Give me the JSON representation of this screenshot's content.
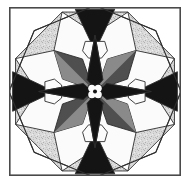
{
  "artwork": {
    "title": "Eight-Pointed Star Quilt Block",
    "type": "geometric-quilt-block",
    "width": 194,
    "height": 186,
    "background": "#ffffff"
  },
  "frame": {
    "name": "outer-border",
    "x": 9,
    "y": 7,
    "width": 172,
    "height": 169,
    "stroke": "#4a4a4a",
    "stroke_width": 1.6,
    "fill": "#ffffff"
  },
  "palette": {
    "white": "#fbfbfb",
    "speckled_light": "#d9d9d9",
    "speckle_dot": "#b4b4b4",
    "medium_gray": "#8a8a8a",
    "dark_gray": "#4f4f4f",
    "black": "#141414",
    "seam": "#2e2e2e",
    "frame": "#4a4a4a"
  },
  "geometry": {
    "center_x": 95,
    "center_y": 91.5,
    "octagon_radius": 86,
    "star_outer_radius": 58,
    "hexagon_inset": 34,
    "seam_width": 0.9
  },
  "layers": {
    "corners_label": "white-corner-triangles",
    "ring_label": "speckled-outer-triangles",
    "star_label": "eight-point-star",
    "hexagons_label": "white-hexagons",
    "spikes_label": "black-edge-triangles",
    "hub_label": "center-pinwheel"
  },
  "star_points": [
    {
      "name": "star-point-north",
      "angle": 270,
      "color": "black",
      "kind": "cardinal"
    },
    {
      "name": "star-point-northeast",
      "angle": 315,
      "color": "dark_gray",
      "kind": "diagonal"
    },
    {
      "name": "star-point-east",
      "angle": 0,
      "color": "black",
      "kind": "cardinal"
    },
    {
      "name": "star-point-southeast",
      "angle": 45,
      "color": "dark_gray",
      "kind": "diagonal"
    },
    {
      "name": "star-point-south",
      "angle": 90,
      "color": "black",
      "kind": "cardinal"
    },
    {
      "name": "star-point-southwest",
      "angle": 135,
      "color": "dark_gray",
      "kind": "diagonal"
    },
    {
      "name": "star-point-west",
      "angle": 180,
      "color": "black",
      "kind": "cardinal"
    },
    {
      "name": "star-point-northwest",
      "angle": 225,
      "color": "dark_gray",
      "kind": "diagonal"
    }
  ],
  "facets": [
    {
      "name": "facet-northeast",
      "angle": 315,
      "color": "medium_gray"
    },
    {
      "name": "facet-southeast",
      "angle": 45,
      "color": "medium_gray"
    },
    {
      "name": "facet-southwest",
      "angle": 135,
      "color": "medium_gray"
    },
    {
      "name": "facet-northwest",
      "angle": 225,
      "color": "medium_gray"
    }
  ],
  "inner_wedges": [
    {
      "name": "inner-wedge-north",
      "angle": 270,
      "color": "medium_gray"
    },
    {
      "name": "inner-wedge-east",
      "angle": 0,
      "color": "medium_gray"
    },
    {
      "name": "inner-wedge-south",
      "angle": 90,
      "color": "medium_gray"
    },
    {
      "name": "inner-wedge-west",
      "angle": 180,
      "color": "medium_gray"
    }
  ],
  "hexagons": [
    {
      "name": "hexagon-north",
      "angle": 270,
      "color": "white"
    },
    {
      "name": "hexagon-east",
      "angle": 0,
      "color": "white"
    },
    {
      "name": "hexagon-south",
      "angle": 90,
      "color": "white"
    },
    {
      "name": "hexagon-west",
      "angle": 180,
      "color": "white"
    }
  ],
  "edge_spikes": [
    {
      "name": "edge-spike-north",
      "angle": 270,
      "color": "black"
    },
    {
      "name": "edge-spike-east",
      "angle": 0,
      "color": "black"
    },
    {
      "name": "edge-spike-south",
      "angle": 90,
      "color": "black"
    },
    {
      "name": "edge-spike-west",
      "angle": 180,
      "color": "black"
    }
  ],
  "outer_triangles": [
    {
      "name": "outer-triangle-north",
      "angle": 270,
      "color": "speckled_light"
    },
    {
      "name": "outer-triangle-northeast",
      "angle": 315,
      "color": "speckled_light"
    },
    {
      "name": "outer-triangle-east",
      "angle": 0,
      "color": "speckled_light"
    },
    {
      "name": "outer-triangle-southeast",
      "angle": 45,
      "color": "speckled_light"
    },
    {
      "name": "outer-triangle-south",
      "angle": 90,
      "color": "speckled_light"
    },
    {
      "name": "outer-triangle-southwest",
      "angle": 135,
      "color": "speckled_light"
    },
    {
      "name": "outer-triangle-west",
      "angle": 180,
      "color": "speckled_light"
    },
    {
      "name": "outer-triangle-northwest",
      "angle": 225,
      "color": "speckled_light"
    }
  ],
  "hub": {
    "name": "center-pinwheel",
    "petal_count": 4,
    "petal_color": "white",
    "hub_color": "black",
    "radius": 9
  }
}
